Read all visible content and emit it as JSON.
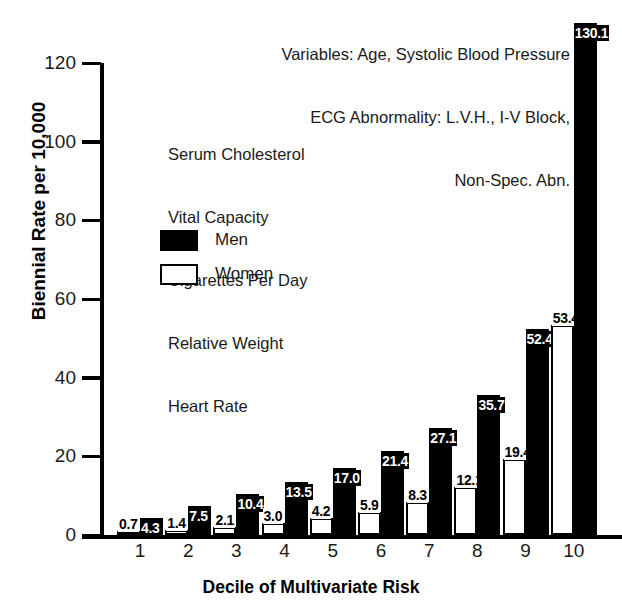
{
  "annotations": {
    "header_lines": [
      "Variables: Age, Systolic Blood Pressure",
      "ECG Abnormality: L.V.H., I-V Block,",
      "Non-Spec. Abn."
    ],
    "list_lines": [
      "Serum Cholesterol",
      "Vital Capacity",
      "Cigarettes Per Day",
      "Relative Weight",
      "Heart Rate"
    ]
  },
  "legend": {
    "position": "inside-upper-left",
    "entries": [
      {
        "label": "Men",
        "color": "#000000"
      },
      {
        "label": "Women",
        "color": "#ffffff"
      }
    ]
  },
  "axes": {
    "ylabel": "Biennial Rate per 10,000",
    "xlabel": "Decile of Multivariate Risk",
    "yticks": [
      "0",
      "20",
      "40",
      "60",
      "80",
      "100",
      "120"
    ]
  },
  "chart_data": {
    "type": "bar",
    "title": "",
    "subtitle": "",
    "xlabel": "Decile of Multivariate Risk",
    "ylabel": "Biennial Rate per 10,000",
    "categories": [
      "1",
      "2",
      "3",
      "4",
      "5",
      "6",
      "7",
      "8",
      "9",
      "10"
    ],
    "series": [
      {
        "name": "Women",
        "color": "#ffffff",
        "values": [
          0.7,
          1.4,
          2.1,
          3.0,
          4.2,
          5.9,
          8.3,
          12.1,
          19.4,
          53.4
        ]
      },
      {
        "name": "Men",
        "color": "#000000",
        "values": [
          4.3,
          7.5,
          10.4,
          13.5,
          17.0,
          21.4,
          27.1,
          35.7,
          52.4,
          130.1
        ]
      }
    ],
    "ylim": [
      0,
      120
    ],
    "ytick_values": [
      0,
      20,
      40,
      60,
      80,
      100,
      120
    ],
    "grid": false,
    "legend_entries": [
      "Men",
      "Women"
    ],
    "annotations": [
      "Variables: Age, Systolic Blood Pressure",
      "ECG Abnormality: L.V.H., I-V Block,",
      "Non-Spec. Abn.",
      "Serum Cholesterol",
      "Vital Capacity",
      "Cigarettes Per Day",
      "Relative Weight",
      "Heart Rate"
    ],
    "note": "Men's decile-10 bar (130.1) exceeds the plotted y-axis maximum and is clipped at the top of the figure."
  }
}
